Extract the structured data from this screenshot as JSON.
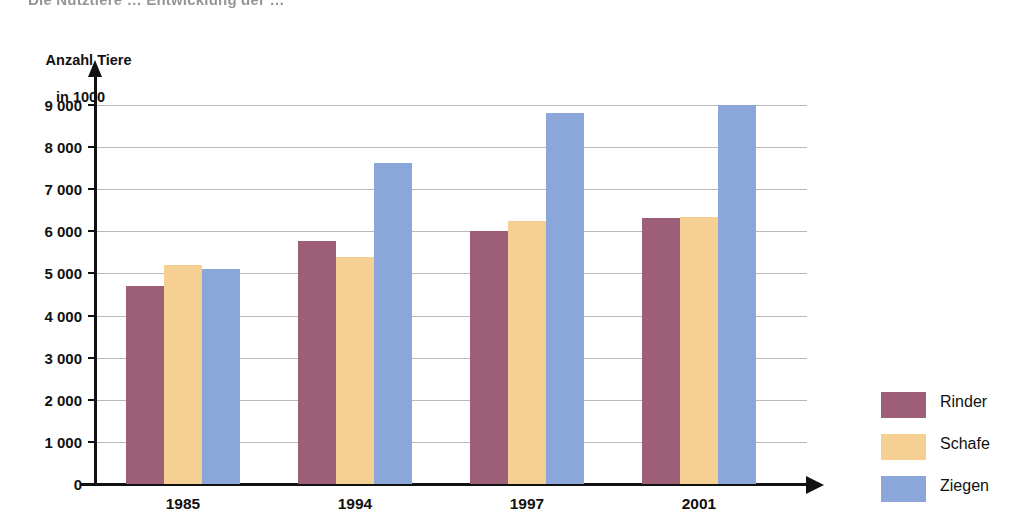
{
  "headline_partial": "Die Nutztiere … Entwicklung der …",
  "axis_title": {
    "line1": "Anzahl Tiere",
    "line2": "in 1000"
  },
  "colors": {
    "rinder": "#9c5f77",
    "schafe": "#f6cf93",
    "ziegen": "#8ba6d9",
    "axis": "#111111",
    "gridline": "#b9b9b9",
    "background": "#ffffff"
  },
  "chart_data": {
    "type": "bar",
    "title": "Anzahl Tiere in 1000",
    "xlabel": "",
    "ylabel": "Anzahl Tiere in 1000",
    "categories": [
      "1985",
      "1994",
      "1997",
      "2001"
    ],
    "series": [
      {
        "name": "Rinder",
        "color": "#9c5f77",
        "values": [
          4700,
          5780,
          6000,
          6320
        ]
      },
      {
        "name": "Schafe",
        "color": "#f6cf93",
        "values": [
          5200,
          5400,
          6250,
          6330
        ]
      },
      {
        "name": "Ziegen",
        "color": "#8ba6d9",
        "values": [
          5100,
          7620,
          8820,
          9000
        ]
      }
    ],
    "ylim": [
      0,
      9400
    ],
    "yticks": [
      0,
      1000,
      2000,
      3000,
      4000,
      5000,
      6000,
      7000,
      8000,
      9000
    ],
    "ytick_labels": [
      "0",
      "1 000",
      "2 000",
      "3 000",
      "4 000",
      "5 000",
      "6 000",
      "7 000",
      "8 000",
      "9 000"
    ],
    "grid": true,
    "legend_position": "right"
  },
  "legend": {
    "items": [
      {
        "label": "Rinder",
        "swatch": "rinder"
      },
      {
        "label": "Schafe",
        "swatch": "schafe"
      },
      {
        "label": "Ziegen",
        "swatch": "ziegen"
      }
    ]
  }
}
